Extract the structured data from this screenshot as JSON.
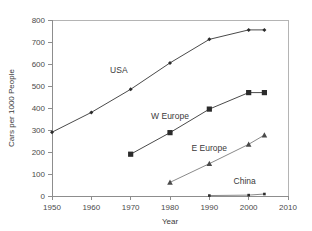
{
  "chart_data": {
    "type": "line",
    "title": "",
    "subtitle": "",
    "xlabel": "Year",
    "ylabel": "Cars per 1000 People",
    "xlim": [
      1950,
      2010
    ],
    "ylim": [
      0,
      800
    ],
    "xticks": [
      1950,
      1960,
      1970,
      1980,
      1990,
      2000,
      2010
    ],
    "yticks": [
      0,
      100,
      200,
      300,
      400,
      500,
      600,
      700,
      800
    ],
    "xtick_labels": [
      "1950",
      "1960",
      "1970",
      "1980",
      "1990",
      "2000",
      "2010"
    ],
    "ytick_labels": [
      "0",
      "100",
      "200",
      "300",
      "400",
      "500",
      "600",
      "700",
      "800"
    ],
    "grid": false,
    "legend": "inline-annotations",
    "series": [
      {
        "name": "USA",
        "marker": "diamond",
        "x": [
          1950,
          1960,
          1970,
          1980,
          1990,
          2000,
          2004
        ],
        "values": [
          290,
          380,
          485,
          605,
          712,
          755,
          755
        ]
      },
      {
        "name": "W Europe",
        "marker": "square",
        "x": [
          1970,
          1980,
          1990,
          2000,
          2004
        ],
        "values": [
          190,
          288,
          395,
          470,
          470
        ]
      },
      {
        "name": "E Europe",
        "marker": "triangle",
        "x": [
          1980,
          1990,
          2000,
          2004
        ],
        "values": [
          62,
          147,
          235,
          277
        ]
      },
      {
        "name": "China",
        "marker": "dot",
        "x": [
          1990,
          2000,
          2004
        ],
        "values": [
          2,
          4,
          9
        ]
      }
    ],
    "annotations": [
      {
        "text": "USA",
        "x": 1967,
        "y": 560
      },
      {
        "text": "W Europe",
        "x": 1980,
        "y": 350
      },
      {
        "text": "E Europe",
        "x": 1990,
        "y": 205
      },
      {
        "text": "China",
        "x": 1999,
        "y": 55
      }
    ]
  },
  "colors": {
    "background": "#ffffff",
    "axis": "#8d8d8d",
    "frame": "#b4b4b4",
    "line": "#4a4a4a",
    "marker": "#2b2b2b",
    "text": "#3a3a3a"
  }
}
